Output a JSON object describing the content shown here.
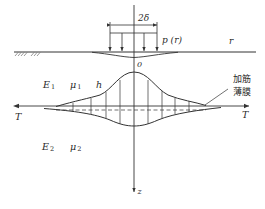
{
  "diagram": {
    "labels": {
      "width": "2δ",
      "load": "p (r)",
      "radial_axis": "r",
      "origin": "0",
      "upper_modulus": "E",
      "upper_modulus_sub": "1",
      "upper_poisson": "μ",
      "upper_poisson_sub": "1",
      "thickness": "h",
      "lower_modulus": "E",
      "lower_modulus_sub": "2",
      "lower_poisson": "μ",
      "lower_poisson_sub": "2",
      "tension_left": "T",
      "tension_right": "T",
      "depth_axis": "z",
      "membrane_line1": "加筋",
      "membrane_line2": "薄膜"
    },
    "colors": {
      "ink": "#333333",
      "background": "#ffffff"
    }
  }
}
